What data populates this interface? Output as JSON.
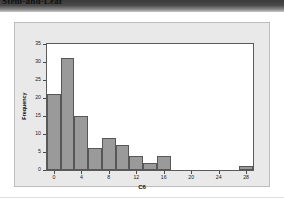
{
  "banner": {
    "title": "Stem-and-Leaf"
  },
  "chart_data": {
    "type": "bar",
    "title": "",
    "xlabel": "C6",
    "ylabel": "Frequency",
    "xlim": [
      -1,
      29
    ],
    "ylim": [
      0,
      35
    ],
    "grid": false,
    "legend": "none",
    "bin_width": 2,
    "xticks": [
      "0",
      "4",
      "8",
      "12",
      "16",
      "20",
      "24",
      "28"
    ],
    "xtick_values": [
      0,
      4,
      8,
      12,
      16,
      20,
      24,
      28
    ],
    "yticks": [
      "0",
      "5",
      "10",
      "15",
      "20",
      "25",
      "30",
      "35"
    ],
    "ytick_values": [
      0,
      5,
      10,
      15,
      20,
      25,
      30,
      35
    ],
    "categories": [
      "0",
      "2",
      "4",
      "6",
      "8",
      "10",
      "12",
      "14",
      "16",
      "18",
      "20",
      "22",
      "24",
      "26",
      "28"
    ],
    "bin_centers": [
      0,
      2,
      4,
      6,
      8,
      10,
      12,
      14,
      16,
      18,
      20,
      22,
      24,
      26,
      28
    ],
    "values": [
      21,
      31,
      15,
      6,
      9,
      7,
      4,
      2,
      4,
      0,
      0,
      0,
      0,
      0,
      1
    ],
    "bar_color": "#9a9a9a",
    "bar_edge_color": "#575757",
    "plot_bg": "#ffffff",
    "panel_bg": "#e9e9e9"
  }
}
